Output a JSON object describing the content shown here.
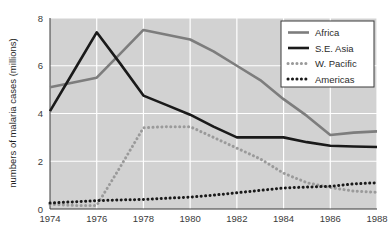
{
  "chart_data": {
    "type": "line",
    "title": "",
    "xlabel": "",
    "ylabel": "numbers of malaria cases (millions)",
    "xlim": [
      1974,
      1988
    ],
    "ylim": [
      0,
      8
    ],
    "grid": true,
    "legend_position": "top-right",
    "x": [
      1974,
      1975,
      1976,
      1977,
      1978,
      1979,
      1980,
      1981,
      1982,
      1983,
      1984,
      1985,
      1986,
      1987,
      1988
    ],
    "xticks": [
      "1974",
      "1976",
      "1978",
      "1980",
      "1982",
      "1984",
      "1986",
      "1988"
    ],
    "xtick_values": [
      1974,
      1976,
      1978,
      1980,
      1982,
      1984,
      1986,
      1988
    ],
    "yticks": [
      "0",
      "2",
      "4",
      "6",
      "8"
    ],
    "ytick_values": [
      0,
      2,
      4,
      6,
      8
    ],
    "series": [
      {
        "name": "Africa",
        "color": "#7d7d7d",
        "style": "solid",
        "width": 2.6,
        "values": [
          5.1,
          5.3,
          5.5,
          6.5,
          7.5,
          7.3,
          7.1,
          6.6,
          6.0,
          5.4,
          4.6,
          3.9,
          3.1,
          3.2,
          3.25
        ]
      },
      {
        "name": "S.E. Asia",
        "color": "#1a1a1a",
        "style": "solid",
        "width": 2.6,
        "values": [
          4.1,
          5.75,
          7.4,
          6.1,
          4.75,
          4.35,
          3.95,
          3.45,
          3.0,
          3.0,
          3.0,
          2.8,
          2.65,
          2.62,
          2.6
        ]
      },
      {
        "name": "W. Pacific",
        "color": "#9a9a9a",
        "style": "dotted",
        "width": 3.0,
        "values": [
          0.2,
          0.15,
          0.15,
          1.75,
          3.4,
          3.45,
          3.45,
          3.0,
          2.55,
          2.1,
          1.5,
          1.1,
          0.9,
          0.75,
          0.7
        ]
      },
      {
        "name": "Americas",
        "color": "#1a1a1a",
        "style": "dotted",
        "width": 3.0,
        "values": [
          0.25,
          0.3,
          0.35,
          0.38,
          0.4,
          0.45,
          0.5,
          0.58,
          0.68,
          0.78,
          0.88,
          0.92,
          0.95,
          1.05,
          1.1
        ]
      }
    ],
    "plot_background": "#d2d2d2",
    "grid_color": "#ffffff",
    "legend_background": "#ffffff",
    "legend_border": "#3a3a3a"
  }
}
